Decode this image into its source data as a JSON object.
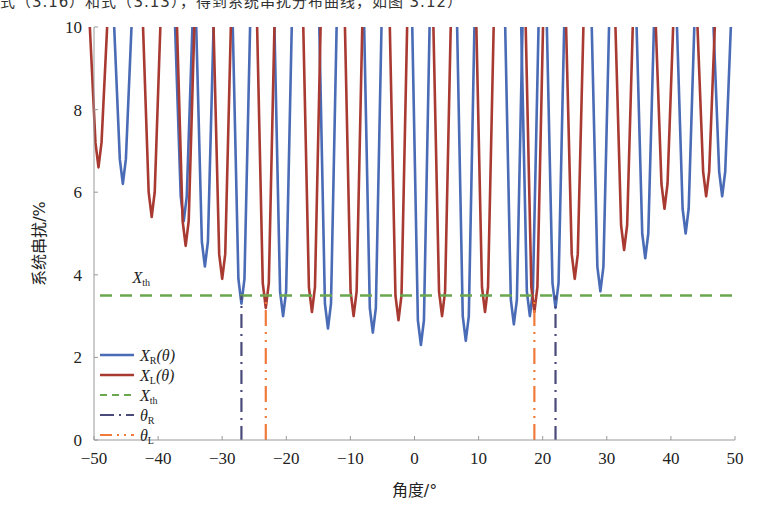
{
  "caption_fragment": "式（3.16）和式（3.13），得到系统串扰分布曲线，如图 3.12）",
  "chart_data": {
    "type": "line",
    "title": "",
    "xlabel": "角度/°",
    "ylabel": "系统串扰/%",
    "xlim": [
      -50,
      50
    ],
    "ylim": [
      0,
      10
    ],
    "xticks": [
      -50,
      -40,
      -30,
      -20,
      -10,
      0,
      10,
      20,
      30,
      40,
      50
    ],
    "yticks": [
      0,
      2,
      4,
      6,
      8,
      10
    ],
    "grid": false,
    "legend_position": "lower-left inside",
    "threshold": {
      "name": "X_th",
      "value": 3.5,
      "label": "X_th"
    },
    "series": [
      {
        "name": "X_R(θ)",
        "color": "#4a6bb5",
        "style": "solid",
        "dip_minima": [
          {
            "x": -45.5,
            "y": 6.2
          },
          {
            "x": -36.0,
            "y": 5.3
          },
          {
            "x": -32.7,
            "y": 4.2
          },
          {
            "x": -27.0,
            "y": 3.3
          },
          {
            "x": -20.5,
            "y": 3.0
          },
          {
            "x": -13.5,
            "y": 2.7
          },
          {
            "x": -6.5,
            "y": 2.6
          },
          {
            "x": 1.0,
            "y": 2.3
          },
          {
            "x": 8.0,
            "y": 2.4
          },
          {
            "x": 15.5,
            "y": 2.8
          },
          {
            "x": 18.0,
            "y": 3.0
          },
          {
            "x": 22.0,
            "y": 3.2
          },
          {
            "x": 29.0,
            "y": 3.6
          },
          {
            "x": 36.0,
            "y": 4.4
          },
          {
            "x": 42.3,
            "y": 5.0
          },
          {
            "x": 48.0,
            "y": 5.9
          }
        ]
      },
      {
        "name": "X_L(θ)",
        "color": "#a83a32",
        "style": "solid",
        "dip_minima": [
          {
            "x": -49.3,
            "y": 6.6
          },
          {
            "x": -41.0,
            "y": 5.4
          },
          {
            "x": -35.7,
            "y": 4.7
          },
          {
            "x": -30.0,
            "y": 3.9
          },
          {
            "x": -23.2,
            "y": 3.2
          },
          {
            "x": -16.0,
            "y": 3.1
          },
          {
            "x": -9.5,
            "y": 3.0
          },
          {
            "x": -2.5,
            "y": 2.9
          },
          {
            "x": 4.3,
            "y": 3.0
          },
          {
            "x": 11.0,
            "y": 3.1
          },
          {
            "x": 18.7,
            "y": 3.1
          },
          {
            "x": 25.0,
            "y": 3.9
          },
          {
            "x": 32.7,
            "y": 4.6
          },
          {
            "x": 39.0,
            "y": 5.6
          },
          {
            "x": 45.5,
            "y": 5.9
          }
        ]
      },
      {
        "name": "X_th",
        "color": "#6aa84f",
        "style": "dashed",
        "x": [
          -50,
          50
        ],
        "y": [
          3.5,
          3.5
        ]
      },
      {
        "name": "θ_R",
        "color": "#4a4a7a",
        "style": "dash-dot",
        "vertical_lines_x": [
          -27.0,
          22.0
        ],
        "from_y": 0,
        "to_y": 3.5
      },
      {
        "name": "θ_L",
        "color": "#f07a3a",
        "style": "dash-dot-dot",
        "vertical_lines_x": [
          -23.2,
          18.7
        ],
        "from_y": 0,
        "to_y": 3.5
      }
    ],
    "annotations": [
      {
        "text": "X_th",
        "x": -44,
        "y": 3.8
      }
    ]
  },
  "legend": [
    {
      "main": "X",
      "sub": "R",
      "tail": "(θ)"
    },
    {
      "main": "X",
      "sub": "L",
      "tail": "(θ)"
    },
    {
      "main": "X",
      "sub": "th",
      "tail": ""
    },
    {
      "main": "θ",
      "sub": "R",
      "tail": ""
    },
    {
      "main": "θ",
      "sub": "L",
      "tail": ""
    }
  ],
  "axes": {
    "xlabel": "角度/°",
    "ylabel": "系统串扰/%"
  }
}
